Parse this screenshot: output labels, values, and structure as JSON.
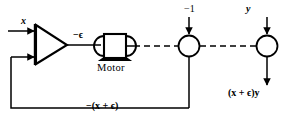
{
  "diagram": {
    "type": "control-system-block-diagram",
    "labels": {
      "input_x": "x",
      "amplifier_output": "−ϵ",
      "motor": "Motor",
      "junction_1_input": "−1",
      "junction_2_input": "y",
      "output": "(x + ϵ)y",
      "feedback": "−(x + ϵ)"
    },
    "blocks": [
      {
        "name": "amplifier",
        "shape": "triangle",
        "inputs": 2,
        "output_label": "−ϵ"
      },
      {
        "name": "motor",
        "shape": "motor-symbol",
        "label": "Motor"
      },
      {
        "name": "summing-junction-1",
        "shape": "circle",
        "input_label": "−1"
      },
      {
        "name": "summing-junction-2",
        "shape": "circle",
        "input_label": "y"
      }
    ],
    "signals": [
      {
        "name": "input-signal",
        "label": "x",
        "style": "solid",
        "direction": "right"
      },
      {
        "name": "amp-to-motor",
        "label": "−ϵ",
        "style": "solid",
        "direction": "right"
      },
      {
        "name": "motor-to-junction1",
        "label": "",
        "style": "dashed",
        "direction": "right"
      },
      {
        "name": "junction1-to-junction2",
        "label": "",
        "style": "dashed",
        "direction": "right"
      },
      {
        "name": "junction1-input",
        "label": "−1",
        "style": "solid",
        "direction": "down"
      },
      {
        "name": "junction2-input",
        "label": "y",
        "style": "solid",
        "direction": "down"
      },
      {
        "name": "output-signal",
        "label": "(x + ϵ)y",
        "style": "solid",
        "direction": "down"
      },
      {
        "name": "feedback-path",
        "label": "−(x + ϵ)",
        "style": "solid",
        "direction": "left-up"
      }
    ],
    "colors": {
      "stroke": "#000000",
      "background": "#ffffff"
    }
  }
}
